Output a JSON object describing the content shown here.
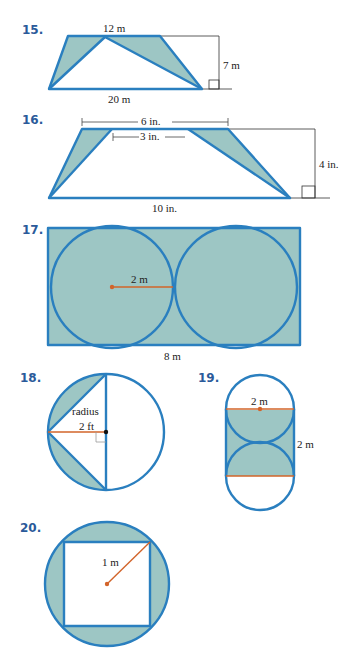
{
  "colors": {
    "edge": "#2a7fbf",
    "shade": "#9dc6c4",
    "radius": "#d2642a",
    "problem_number": "#2a5a9a"
  },
  "problems": [
    {
      "number": "15.",
      "labels": {
        "top": "12 m",
        "height": "7 m",
        "bottom": "20 m"
      }
    },
    {
      "number": "16.",
      "labels": {
        "outer_top": "6 in.",
        "inner_top": "3 in.",
        "height": "4 in.",
        "bottom": "10 in."
      }
    },
    {
      "number": "17.",
      "labels": {
        "radius": "2 m",
        "width": "8 m"
      }
    },
    {
      "number": "18.",
      "labels": {
        "radius_word": "radius",
        "radius": "2 ft"
      }
    },
    {
      "number": "19.",
      "labels": {
        "diameter": "2 m",
        "side": "2 m"
      }
    },
    {
      "number": "20.",
      "labels": {
        "radius": "1 m"
      }
    }
  ]
}
